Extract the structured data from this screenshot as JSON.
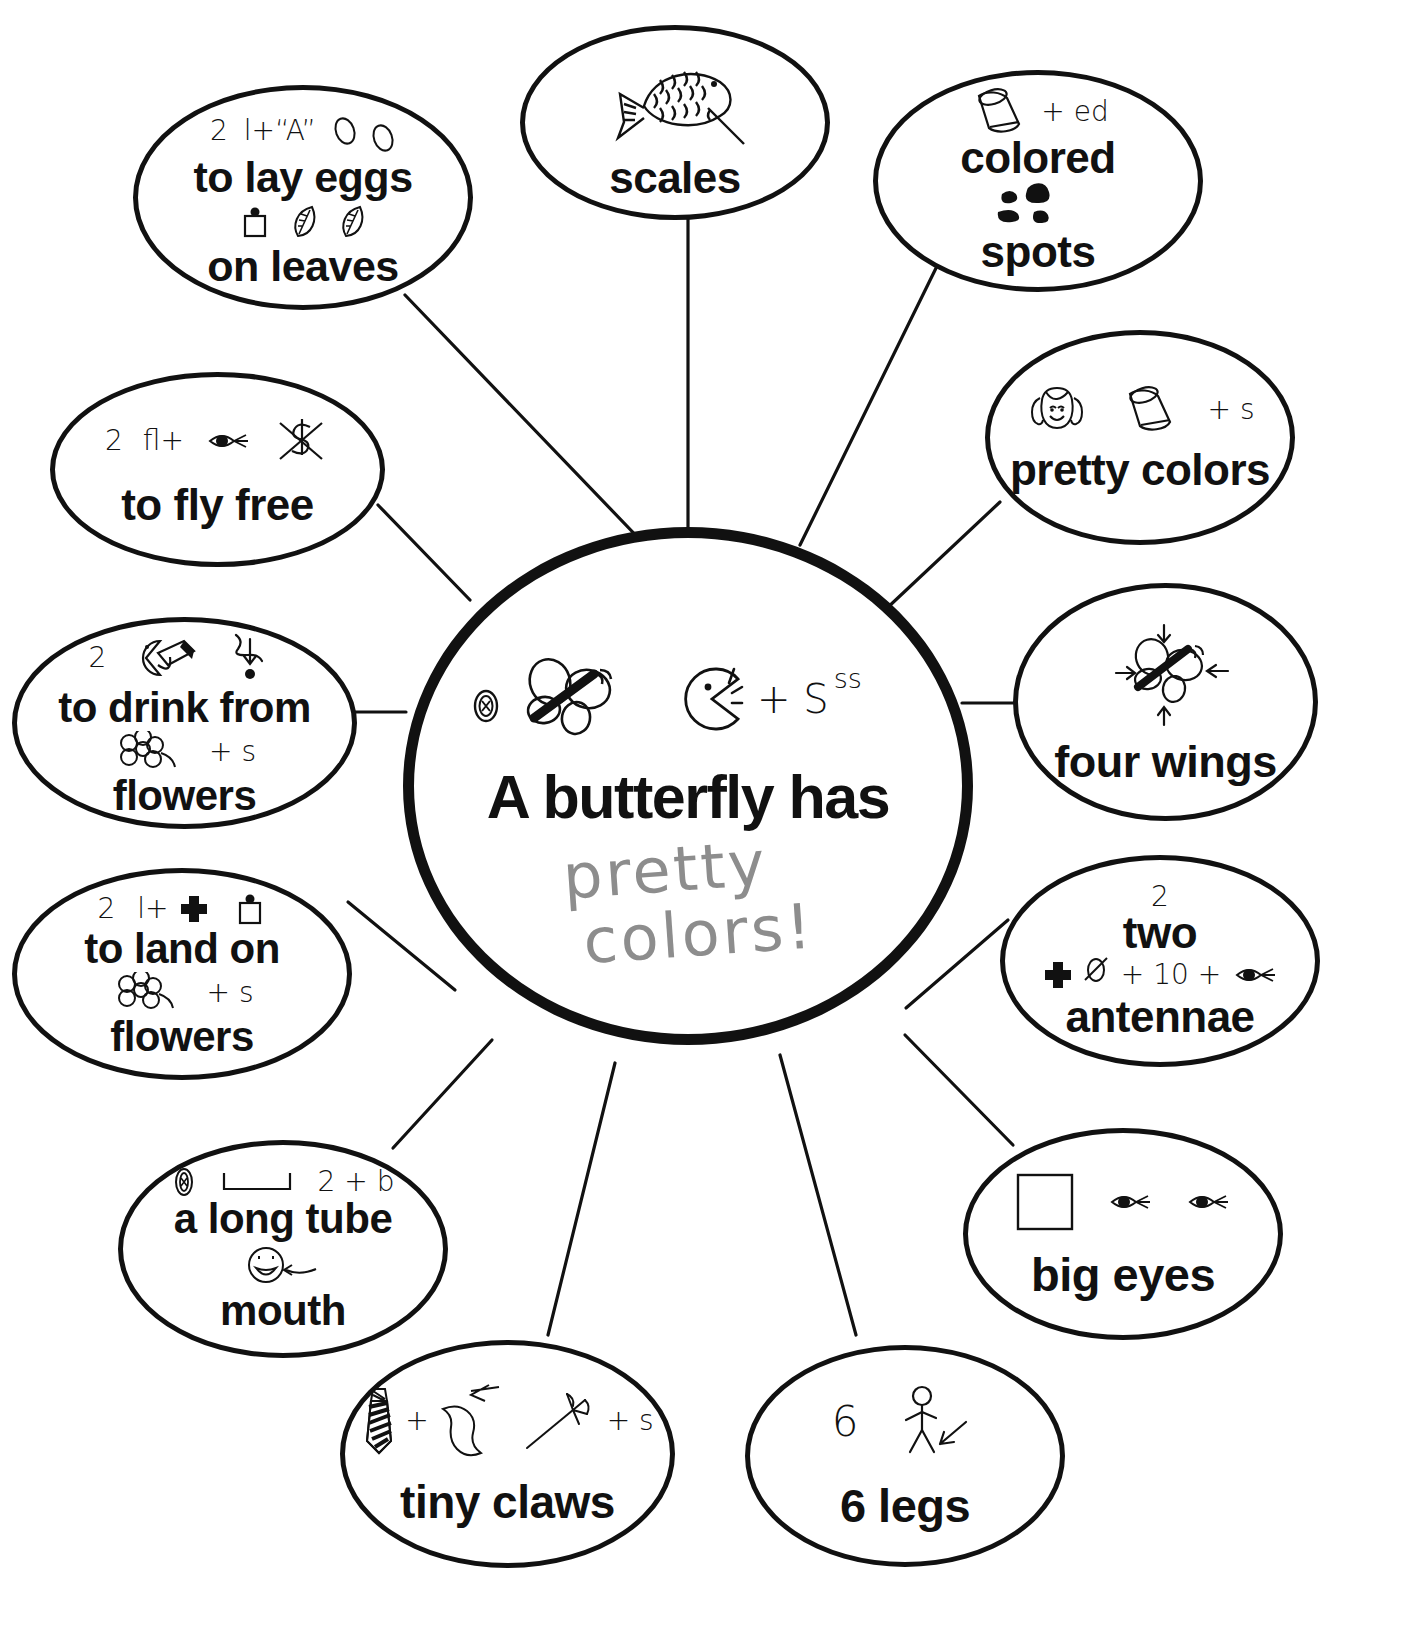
{
  "worksheet": {
    "center": {
      "title": "A butterfly has",
      "handwritten_answer_line1": "pretty",
      "handwritten_answer_line2": "colors!",
      "handwritten_color": "#8d8d8d",
      "rebus_icons": [
        "butterfly-icon",
        "pacman-mouth-icon"
      ],
      "rebus_text": "+ S",
      "rebus_superscript": "ss"
    },
    "ink_color": "#111111",
    "paper_color": "#ffffff",
    "bubbles": [
      {
        "id": "to-lay-eggs-on-leaves",
        "lines": [
          "to lay eggs",
          "on leaves"
        ],
        "rebus_top": {
          "count": "2",
          "clue": "l+“A”",
          "icons": [
            "egg-icon",
            "egg-icon"
          ]
        },
        "rebus_mid": {
          "icons": [
            "jar-icon",
            "leaf-icon",
            "leaf-icon"
          ]
        }
      },
      {
        "id": "scales",
        "lines": [
          "scales"
        ],
        "rebus_top": {
          "icons": [
            "fish-icon"
          ]
        }
      },
      {
        "id": "colored-spots",
        "lines": [
          "colored",
          "spots"
        ],
        "rebus_top": {
          "icons": [
            "crayon-icon"
          ],
          "suffix": "+ ed"
        },
        "rebus_mid": {
          "icons": [
            "ink-spots-icon"
          ]
        }
      },
      {
        "id": "pretty-colors",
        "lines": [
          "pretty colors"
        ],
        "rebus_top": {
          "icons": [
            "girl-face-icon",
            "crayon-icon"
          ],
          "suffix": "+ s"
        }
      },
      {
        "id": "to-fly-free",
        "lines": [
          "to fly free"
        ],
        "rebus_top": {
          "count": "2",
          "clue": "fl+",
          "icons": [
            "eye-icon",
            "dollar-crossed-icon"
          ]
        }
      },
      {
        "id": "four-wings",
        "lines": [
          "four wings"
        ],
        "rebus_top": {
          "icons": [
            "butterfly-arrows-icon"
          ]
        }
      },
      {
        "id": "to-drink-from-flowers",
        "lines": [
          "to drink from",
          "flowers"
        ],
        "rebus_top": {
          "count": "2",
          "icons": [
            "mouth-drink-icon",
            "drop-arrow-icon"
          ]
        },
        "rebus_mid": {
          "icons": [
            "flower-icon"
          ],
          "suffix": "+ s"
        }
      },
      {
        "id": "to-land-on-flowers",
        "lines": [
          "to land on",
          "flowers"
        ],
        "rebus_top": {
          "count": "2",
          "clue": "l+",
          "icons": [
            "plus-cross-icon",
            "jar-icon"
          ]
        },
        "rebus_mid": {
          "icons": [
            "flower-icon"
          ],
          "suffix": "+ s"
        }
      },
      {
        "id": "two-antennae",
        "lines": [
          "two",
          "antennae"
        ],
        "rebus_top": {
          "count": "2"
        },
        "rebus_mid": {
          "icons": [
            "plus-cross-icon",
            "zero-slash-icon"
          ],
          "clue": "+ 10 +",
          "icons2": [
            "eye-icon"
          ]
        }
      },
      {
        "id": "a-long-tube-mouth",
        "lines": [
          "a long tube",
          "mouth"
        ],
        "rebus_top": {
          "icons": [
            "pill-icon",
            "u-bracket-icon"
          ],
          "clue": "2 + b"
        },
        "rebus_mid": {
          "icons": [
            "smiley-mouth-icon"
          ]
        }
      },
      {
        "id": "big-eyes",
        "lines": [
          "big eyes"
        ],
        "rebus_top": {
          "icons": [
            "square-icon",
            "eye-icon",
            "eye-icon"
          ]
        }
      },
      {
        "id": "tiny-claws",
        "lines": [
          "tiny claws"
        ],
        "rebus_top": {
          "icons": [
            "tie-icon"
          ],
          "clue": "+",
          "icons2": [
            "knee-arrow-icon",
            "claw-icon"
          ],
          "suffix": "+ s"
        }
      },
      {
        "id": "6-legs",
        "lines": [
          "6 legs"
        ],
        "rebus_top": {
          "count": "6",
          "icons": [
            "stick-figure-arrow-icon"
          ]
        }
      }
    ]
  }
}
